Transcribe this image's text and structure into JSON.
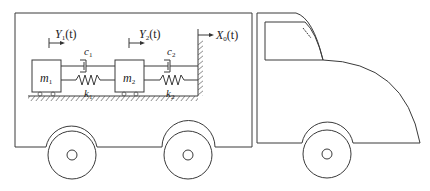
{
  "diagram": {
    "colors": {
      "stroke": "#3a3a3a",
      "background": "#ffffff"
    },
    "masses": [
      {
        "id": "m1",
        "symbol": "m",
        "sub": "1"
      },
      {
        "id": "m2",
        "symbol": "m",
        "sub": "2"
      }
    ],
    "dampers": [
      {
        "id": "c1",
        "symbol": "c",
        "sub": "1"
      },
      {
        "id": "c2",
        "symbol": "c",
        "sub": "2"
      }
    ],
    "springs": [
      {
        "id": "k1",
        "symbol": "k",
        "sub": "1"
      },
      {
        "id": "k2",
        "symbol": "k",
        "sub": "2"
      }
    ],
    "displacements": [
      {
        "id": "Y1",
        "symbol": "Y",
        "sub": "1",
        "arg": "(t)"
      },
      {
        "id": "Y2",
        "symbol": "Y",
        "sub": "2",
        "arg": "(t)"
      },
      {
        "id": "X0",
        "symbol": "X",
        "sub": "0",
        "arg": "(t)"
      }
    ],
    "vehicle": {
      "parts": [
        "cargo-box",
        "cab",
        "windshield",
        "wiper",
        "rear-wheel-1",
        "rear-wheel-2",
        "front-wheel"
      ]
    }
  }
}
